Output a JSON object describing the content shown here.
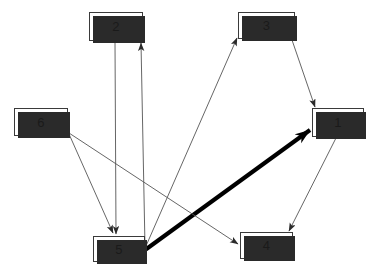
{
  "diagram": {
    "type": "directed-graph",
    "canvas": {
      "width": 375,
      "height": 275
    },
    "background_color": "#ffffff",
    "node_fill_color": "#ffffff",
    "node_border_color": "#3a3a3a",
    "node_shadow_color": "#2a2a2a",
    "edge_color": "#555555",
    "bold_edge_color": "#000000",
    "nodes": [
      {
        "id": "1",
        "label": "1",
        "x": 312,
        "y": 108,
        "w": 52,
        "h": 29
      },
      {
        "id": "2",
        "label": "2",
        "x": 89,
        "y": 12,
        "w": 54,
        "h": 29
      },
      {
        "id": "3",
        "label": "3",
        "x": 238,
        "y": 12,
        "w": 57,
        "h": 27
      },
      {
        "id": "4",
        "label": "4",
        "x": 240,
        "y": 232,
        "w": 53,
        "h": 27
      },
      {
        "id": "5",
        "label": "5",
        "x": 93,
        "y": 236,
        "w": 52,
        "h": 26
      },
      {
        "id": "6",
        "label": "6",
        "x": 14,
        "y": 108,
        "w": 54,
        "h": 28
      }
    ],
    "edges": [
      {
        "from": "5",
        "to": "2",
        "weight": "thin",
        "x1": 145,
        "y1": 247,
        "x2": 141,
        "y2": 43
      },
      {
        "from": "2",
        "to": "5",
        "weight": "thin",
        "x1": 115,
        "y1": 42,
        "x2": 116,
        "y2": 234
      },
      {
        "from": "5",
        "to": "3",
        "weight": "thin",
        "x1": 146,
        "y1": 246,
        "x2": 237,
        "y2": 38
      },
      {
        "from": "3",
        "to": "1",
        "weight": "thin",
        "x1": 292,
        "y1": 40,
        "x2": 315,
        "y2": 107
      },
      {
        "from": "5",
        "to": "1",
        "weight": "bold",
        "x1": 145,
        "y1": 250,
        "x2": 310,
        "y2": 130
      },
      {
        "from": "1",
        "to": "4",
        "weight": "thin",
        "x1": 336,
        "y1": 138,
        "x2": 289,
        "y2": 231
      },
      {
        "from": "6",
        "to": "5",
        "weight": "thin",
        "x1": 69,
        "y1": 134,
        "x2": 113,
        "y2": 233
      },
      {
        "from": "6",
        "to": "4",
        "weight": "thin",
        "x1": 69,
        "y1": 133,
        "x2": 238,
        "y2": 244
      }
    ]
  }
}
